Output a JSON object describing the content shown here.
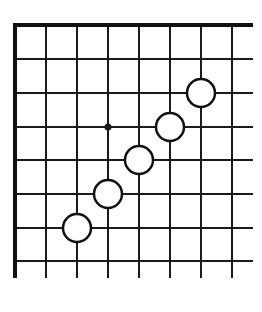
{
  "diagram": {
    "type": "go-board-corner",
    "corner": "top-left",
    "colors": {
      "background": "#ffffff",
      "line": "#1a1a1a",
      "border": "#111111",
      "stone_fill": "#ffffff",
      "stone_stroke": "#111111"
    },
    "grid": {
      "x_lines": [
        46,
        77,
        108,
        139,
        170,
        201,
        232
      ],
      "y_lines": [
        59,
        93,
        127,
        160,
        194,
        228,
        261
      ],
      "edge_left_x": 15,
      "edge_top_y": 25,
      "extent_right_x": 253,
      "extent_bottom_y": 278
    },
    "star_points": [
      {
        "x": 108,
        "y": 127
      }
    ],
    "stones": [
      {
        "color": "white",
        "x": 77,
        "y": 228
      },
      {
        "color": "white",
        "x": 108,
        "y": 194
      },
      {
        "color": "white",
        "x": 139,
        "y": 160
      },
      {
        "color": "white",
        "x": 170,
        "y": 127
      },
      {
        "color": "white",
        "x": 201,
        "y": 93
      }
    ],
    "stone_radius": 14
  }
}
